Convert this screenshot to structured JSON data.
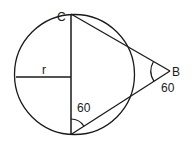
{
  "diagram": {
    "title": "",
    "stroke_color": "#1a1a1a",
    "background": "#ffffff",
    "circle": {
      "cx": 74.5,
      "cy": 74.5,
      "r": 60
    },
    "points": {
      "C": {
        "x": 71,
        "y": 14,
        "label": "C"
      },
      "B": {
        "x": 170,
        "y": 71,
        "label": "B"
      },
      "bottom": {
        "x": 71,
        "y": 134.5,
        "label": ""
      }
    },
    "radius_segment": {
      "from": {
        "x": 16,
        "y": 77
      },
      "to": {
        "x": 71,
        "y": 77
      },
      "label": "r"
    },
    "angles": [
      {
        "vertex": "B",
        "value": "60"
      },
      {
        "vertex": "bottom",
        "value": "60"
      }
    ],
    "labels": {
      "C": "C",
      "B": "B",
      "r": "r",
      "angle_B": "60",
      "angle_bottom": "60"
    }
  }
}
